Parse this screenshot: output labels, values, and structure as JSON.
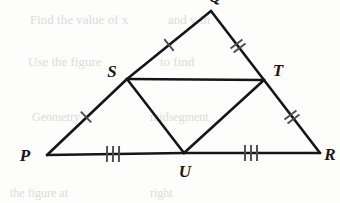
{
  "figure": {
    "background_color": "#fdfdfc",
    "stroke_color": "#16161a",
    "tick_color": "#4a4a52",
    "stroke_width": 2.6,
    "tick_width": 1.9,
    "vertices": [
      {
        "id": "Q",
        "label": "Q",
        "x": 211,
        "y": 11,
        "label_x": 215,
        "label_y": 2,
        "anchor": "middle",
        "clipped": true
      },
      {
        "id": "S",
        "label": "S",
        "x": 127,
        "y": 79,
        "label_x": 112,
        "label_y": 77,
        "anchor": "middle",
        "clipped": false
      },
      {
        "id": "T",
        "label": "T",
        "x": 264,
        "y": 80,
        "label_x": 278,
        "label_y": 76,
        "anchor": "middle",
        "clipped": false
      },
      {
        "id": "P",
        "label": "P",
        "x": 47,
        "y": 155,
        "label_x": 25,
        "label_y": 161,
        "anchor": "middle",
        "clipped": false
      },
      {
        "id": "U",
        "label": "U",
        "x": 184,
        "y": 153,
        "label_x": 185,
        "label_y": 177,
        "anchor": "middle",
        "clipped": false
      },
      {
        "id": "R",
        "label": "R",
        "x": 320,
        "y": 153,
        "label_x": 330,
        "label_y": 160,
        "anchor": "middle",
        "clipped": false
      }
    ],
    "segments": [
      {
        "id": "SQ",
        "from": "S",
        "to": "Q",
        "x1": 127,
        "y1": 79,
        "x2": 211,
        "y2": 11,
        "ticks": 1
      },
      {
        "id": "QT",
        "from": "Q",
        "to": "T",
        "x1": 211,
        "y1": 11,
        "x2": 264,
        "y2": 80,
        "ticks": 2
      },
      {
        "id": "PS",
        "from": "P",
        "to": "S",
        "x1": 47,
        "y1": 155,
        "x2": 127,
        "y2": 79,
        "ticks": 1
      },
      {
        "id": "TR",
        "from": "T",
        "to": "R",
        "x1": 264,
        "y1": 80,
        "x2": 320,
        "y2": 153,
        "ticks": 2
      },
      {
        "id": "PU",
        "from": "P",
        "to": "U",
        "x1": 47,
        "y1": 155,
        "x2": 184,
        "y2": 153,
        "ticks": 3
      },
      {
        "id": "UR",
        "from": "U",
        "to": "R",
        "x1": 184,
        "y1": 153,
        "x2": 320,
        "y2": 153,
        "ticks": 3
      },
      {
        "id": "ST",
        "from": "S",
        "to": "T",
        "x1": 127,
        "y1": 79,
        "x2": 264,
        "y2": 80,
        "ticks": 0
      },
      {
        "id": "SU",
        "from": "S",
        "to": "U",
        "x1": 127,
        "y1": 79,
        "x2": 184,
        "y2": 153,
        "ticks": 0
      },
      {
        "id": "UT",
        "from": "U",
        "to": "T",
        "x1": 184,
        "y1": 153,
        "x2": 264,
        "y2": 80,
        "ticks": 0
      }
    ],
    "tick_marks": [
      {
        "segment": "SQ",
        "count": 1,
        "center_x": 169,
        "center_y": 45,
        "angle_deg": -39.0,
        "length": 15,
        "spacing": 5
      },
      {
        "segment": "QT",
        "count": 2,
        "center_x": 238,
        "center_y": 46,
        "angle_deg": 52.5,
        "length": 15,
        "spacing": 5
      },
      {
        "segment": "PS",
        "count": 1,
        "center_x": 86,
        "center_y": 117,
        "angle_deg": -43.5,
        "length": 15,
        "spacing": 5
      },
      {
        "segment": "TR",
        "count": 2,
        "center_x": 292,
        "center_y": 117,
        "angle_deg": 52.5,
        "length": 15,
        "spacing": 5
      },
      {
        "segment": "PU",
        "count": 3,
        "center_x": 113,
        "center_y": 154,
        "angle_deg": 0.8,
        "length": 16,
        "spacing": 6
      },
      {
        "segment": "UR",
        "count": 3,
        "center_x": 251,
        "center_y": 153,
        "angle_deg": 0,
        "length": 16,
        "spacing": 6
      }
    ],
    "ghost_marks": [
      {
        "text": "Find the value of x",
        "x": 30,
        "y": 12,
        "size": 13
      },
      {
        "text": "and y in",
        "x": 168,
        "y": 12,
        "size": 13
      },
      {
        "text": "Use the figure",
        "x": 28,
        "y": 54,
        "size": 13
      },
      {
        "text": "to find",
        "x": 160,
        "y": 54,
        "size": 13
      },
      {
        "text": "Geometry",
        "x": 32,
        "y": 110,
        "size": 12
      },
      {
        "text": "midsegment",
        "x": 150,
        "y": 110,
        "size": 12
      },
      {
        "text": "the figure at",
        "x": 10,
        "y": 186,
        "size": 12
      },
      {
        "text": "right",
        "x": 150,
        "y": 186,
        "size": 12
      }
    ]
  }
}
